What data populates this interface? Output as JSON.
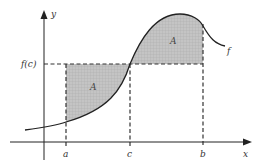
{
  "diagram": {
    "axes": {
      "x_label": "x",
      "y_label": "y"
    },
    "level_label": "f(c)",
    "curve_label": "f",
    "x_ticks": [
      {
        "id": "a",
        "label": "a"
      },
      {
        "id": "c",
        "label": "c"
      },
      {
        "id": "b",
        "label": "b"
      }
    ],
    "regions": [
      {
        "id": "left",
        "label": "A",
        "description": "area under f(c) above curve from a to c"
      },
      {
        "id": "right",
        "label": "A",
        "description": "area under curve above f(c) from c to b"
      }
    ],
    "colors": {
      "axis": "#222222",
      "curve": "#222222",
      "shade": "#b8b8b8",
      "dashed": "#333333"
    }
  }
}
